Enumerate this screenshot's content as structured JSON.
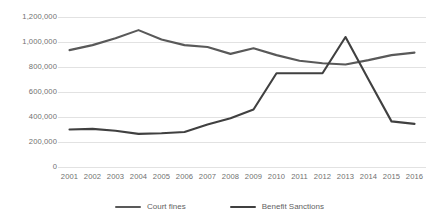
{
  "chart_data": {
    "type": "line",
    "title": "",
    "xlabel": "",
    "ylabel": "",
    "grid": true,
    "legend_position": "bottom",
    "ylim": [
      0,
      1200000
    ],
    "ytick_labels": [
      "1,200,000",
      "1,000,000",
      "800,000",
      "600,000",
      "400,000",
      "200,000",
      "0"
    ],
    "ytick_values": [
      1200000,
      1000000,
      800000,
      600000,
      400000,
      200000,
      0
    ],
    "categories": [
      "2001",
      "2002",
      "2003",
      "2004",
      "2005",
      "2006",
      "2007",
      "2008",
      "2009",
      "2010",
      "2011",
      "2012",
      "2013",
      "2014",
      "2015",
      "2016"
    ],
    "series": [
      {
        "name": "Court fines",
        "color": "#595959",
        "values": [
          935000,
          975000,
          1030000,
          1095000,
          1020000,
          975000,
          960000,
          905000,
          950000,
          895000,
          850000,
          830000,
          820000,
          855000,
          895000,
          915000
        ]
      },
      {
        "name": "Benefit Sanctions",
        "color": "#404040",
        "values": [
          300000,
          305000,
          290000,
          265000,
          270000,
          280000,
          340000,
          390000,
          460000,
          750000,
          750000,
          750000,
          1040000,
          700000,
          365000,
          345000
        ]
      }
    ]
  },
  "legend": {
    "items": [
      {
        "label": "Court fines",
        "color": "#595959"
      },
      {
        "label": "Benefit Sanctions",
        "color": "#404040"
      }
    ]
  },
  "axes": {
    "grid_color": "#e2e2e2"
  }
}
